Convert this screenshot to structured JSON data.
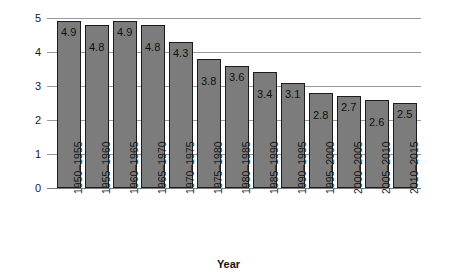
{
  "chart_data": {
    "type": "bar",
    "title": "",
    "xlabel": "Year",
    "ylabel": "Fertility rate",
    "categories": [
      "1950–1955",
      "1955–1960",
      "1960–1965",
      "1965–1970",
      "1970–1975",
      "1975–1980",
      "1980–1985",
      "1985–1990",
      "1990–1995",
      "1995–2000",
      "2000–2005",
      "2005–2010",
      "2010–2015"
    ],
    "values": [
      4.9,
      4.8,
      4.9,
      4.8,
      4.3,
      3.8,
      3.6,
      3.4,
      3.1,
      2.8,
      2.7,
      2.6,
      2.5
    ],
    "value_labels": [
      "4.9",
      "4.8",
      "4.9",
      "4.8",
      "4.3",
      "3.8",
      "3.6",
      "3.4",
      "3.1",
      "2.8",
      "2.7",
      "2.6",
      "2.5"
    ],
    "ylim": [
      0,
      5
    ],
    "yticks": [
      0,
      1,
      2,
      3,
      4,
      5
    ],
    "ytick_labels": [
      "0",
      "1",
      "2",
      "3",
      "4",
      "5"
    ],
    "grid": true,
    "legend": "none",
    "bar_color": "#7c7c7c",
    "bar_border_color": "#1c1c1c",
    "grid_color": "#9a9a9a",
    "text_color": "#1a1a1a"
  }
}
